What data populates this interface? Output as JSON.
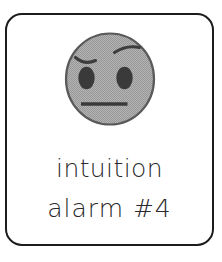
{
  "card": {
    "border_color": "#1c1c1c",
    "background_color": "#ffffff",
    "corner_radius_px": 17
  },
  "emoji": {
    "name": "face-with-raised-eyebrow",
    "face_fill_color": "#a8a8a8",
    "face_outline_color": "#4a4a4a",
    "feature_color": "#3a3a3a",
    "features": [
      {
        "name": "left-eyebrow",
        "shape": "shallow-downward-arc"
      },
      {
        "name": "right-eyebrow",
        "shape": "raised-tilted-arc"
      },
      {
        "name": "left-eye",
        "shape": "dark-oval"
      },
      {
        "name": "right-eye",
        "shape": "dark-oval"
      },
      {
        "name": "mouth",
        "shape": "straight-horizontal-line"
      }
    ]
  },
  "caption": {
    "line1": "intuition",
    "line2": "alarm #4",
    "text_color": "#2a2a2a"
  }
}
